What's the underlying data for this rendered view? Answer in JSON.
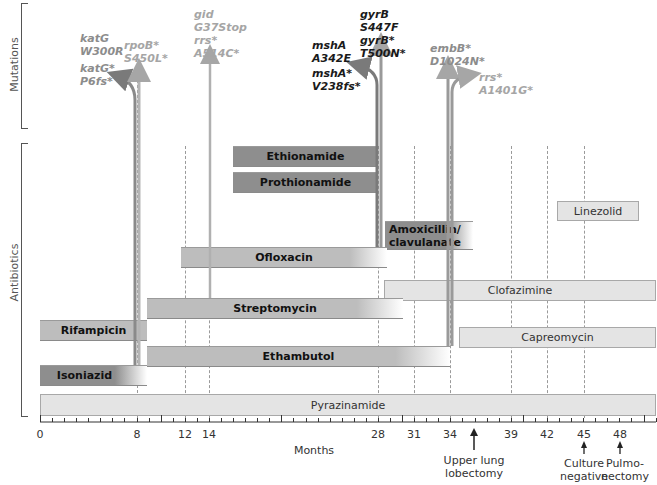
{
  "chart_data": {
    "type": "timeline",
    "title": "",
    "xlabel": "Months",
    "xlim": [
      0,
      51
    ],
    "x_ticks": [
      0,
      8,
      12,
      14,
      28,
      31,
      34,
      39,
      42,
      45,
      48
    ],
    "row_groups": [
      "Mutations",
      "Antibiotics"
    ],
    "antibiotics": [
      {
        "name": "Ethionamide",
        "start": 16,
        "end": 28,
        "style": "dark"
      },
      {
        "name": "Prothionamide",
        "start": 16,
        "end": 28,
        "style": "dark"
      },
      {
        "name": "Amoxicillin/ clavulanate",
        "start": 28.5,
        "end": 36,
        "style": "dark"
      },
      {
        "name": "Linezolid",
        "start": 43,
        "end": 50,
        "style": "light"
      },
      {
        "name": "Ofloxacin",
        "start": 11.7,
        "end": 28.6,
        "style": "mid"
      },
      {
        "name": "Clofazimine",
        "start": 28.5,
        "end": 51,
        "style": "light"
      },
      {
        "name": "Streptomycin",
        "start": 8.8,
        "end": 29.8,
        "style": "mid"
      },
      {
        "name": "Rifampicin",
        "start": 0,
        "end": 8.8,
        "style": "mid"
      },
      {
        "name": "Capreomycin",
        "start": 34.7,
        "end": 51,
        "style": "light"
      },
      {
        "name": "Ethambutol",
        "start": 8.8,
        "end": 34,
        "style": "mid"
      },
      {
        "name": "Isoniazid",
        "start": 0,
        "end": 8.8,
        "style": "dark"
      },
      {
        "name": "Pyrazinamide",
        "start": 0,
        "end": 51,
        "style": "light"
      }
    ],
    "mutations": [
      {
        "month": 8,
        "labels": [
          "katG",
          "W300R"
        ],
        "color": "grey"
      },
      {
        "month": 8,
        "labels": [
          "katG*",
          "P6fs*"
        ],
        "color": "grey"
      },
      {
        "month": 8,
        "labels": [
          "rpoB*",
          "S450L*"
        ],
        "color": "grey"
      },
      {
        "month": 14,
        "labels": [
          "gid",
          "G37Stop",
          "rrs*",
          "A514C*"
        ],
        "color": "grey"
      },
      {
        "month": 28,
        "labels": [
          "mshA",
          "A342E"
        ],
        "color": "black"
      },
      {
        "month": 28,
        "labels": [
          "mshA*",
          "V238fs*"
        ],
        "color": "black"
      },
      {
        "month": 28,
        "labels": [
          "gyrB",
          "S447F",
          "gyrB*",
          "T500N*"
        ],
        "color": "black"
      },
      {
        "month": 34,
        "labels": [
          "embB*",
          "D1024N*"
        ],
        "color": "grey"
      },
      {
        "month": 34,
        "labels": [
          "rrs*",
          "A1401G*"
        ],
        "color": "grey"
      }
    ],
    "events": [
      {
        "month": 36,
        "label": "Upper lung lobectomy"
      },
      {
        "month": 45,
        "label": "Culture negative"
      },
      {
        "month": 48,
        "label": "Pulmo- nectomy"
      }
    ],
    "grid": "dashed vertical lines at key months"
  },
  "axis": {
    "label": "Months",
    "ticks": [
      "0",
      "8",
      "12",
      "14",
      "28",
      "31",
      "34",
      "39",
      "42",
      "45",
      "48"
    ]
  },
  "groups": {
    "mutations": "Mutations",
    "antibiotics": "Antibiotics"
  },
  "bars": {
    "ethionamide": "Ethionamide",
    "prothionamide": "Prothionamide",
    "amox1": "Amoxicillin/",
    "amox2": "clavulanate",
    "linezolid": "Linezolid",
    "ofloxacin": "Ofloxacin",
    "clofazimine": "Clofazimine",
    "streptomycin": "Streptomycin",
    "rifampicin": "Rifampicin",
    "capreomycin": "Capreomycin",
    "ethambutol": "Ethambutol",
    "isoniazid": "Isoniazid",
    "pyrazinamide": "Pyrazinamide"
  },
  "mutations": {
    "katg1": [
      "katG",
      "W300R"
    ],
    "katg2": [
      "katG*",
      "P6fs*"
    ],
    "rpob": [
      "rpoB*",
      "S450L*"
    ],
    "gid": [
      "gid",
      "G37Stop",
      "rrs*",
      "A514C*"
    ],
    "msha1": [
      "mshA",
      "A342E"
    ],
    "msha2": [
      "mshA*",
      "V238fs*"
    ],
    "gyrb": [
      "gyrB",
      "S447F",
      "gyrB*",
      "T500N*"
    ],
    "embb": [
      "embB*",
      "D1024N*"
    ],
    "rrs": [
      "rrs*",
      "A1401G*"
    ]
  },
  "events": {
    "lobectomy": [
      "Upper lung",
      "lobectomy"
    ],
    "culture": [
      "Culture",
      "negative"
    ],
    "pulmo": [
      "Pulmo-",
      "nectomy"
    ]
  },
  "colors": {
    "dark_bar": "#8e8e8e",
    "mid_bar": "#bdbdbd",
    "light_bar": "#e4e4e4",
    "grey_arrow": "#a6a6a6",
    "dark_arrow": "#7a7a7a"
  }
}
